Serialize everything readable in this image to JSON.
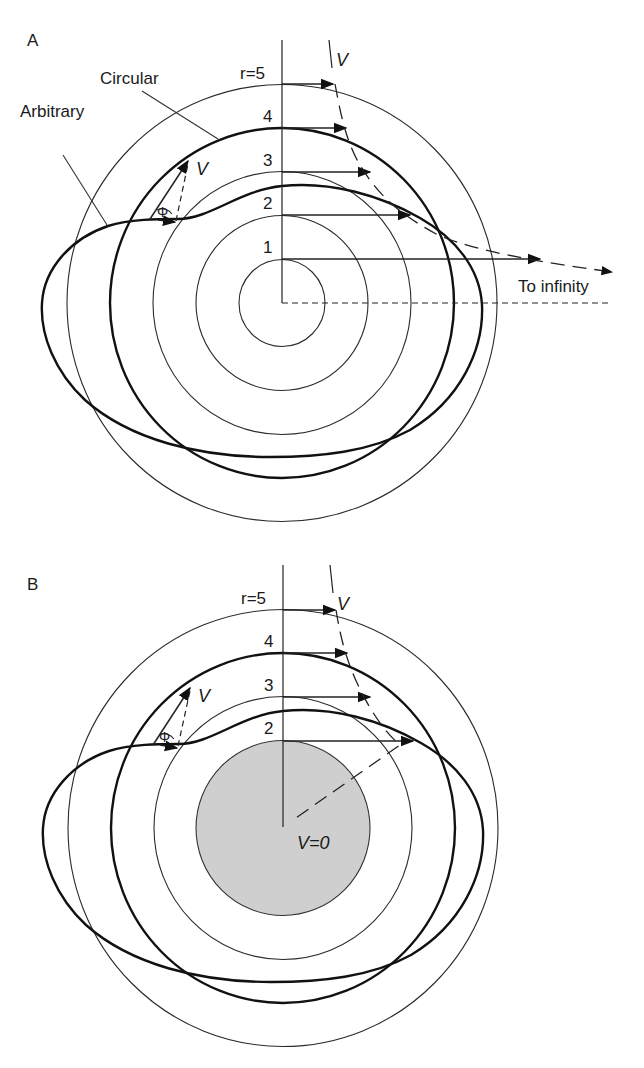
{
  "figure": {
    "panels": [
      {
        "id": "A",
        "label": "A",
        "center": [
          282,
          303
        ],
        "unit_radius_px": 43.3,
        "radius_labels": [
          "1",
          "2",
          "3",
          "4",
          "r=5"
        ],
        "curve_labels": {
          "circular": "Circular",
          "arbitrary": "Arbitrary"
        },
        "velocity_symbol": "V",
        "angle_symbol": "Φ",
        "far_field_label": "To infinity",
        "inner_boundary": "none"
      },
      {
        "id": "B",
        "label": "B",
        "center": [
          283,
          828
        ],
        "unit_radius_px": 43.3,
        "radius_labels": [
          "2",
          "3",
          "4",
          "r=5"
        ],
        "velocity_symbol": "V",
        "angle_symbol": "Φ",
        "inner_boundary": "shaded disk of radius 2",
        "inner_boundary_label": "V=0",
        "inner_boundary_color": "#cfcfcf"
      }
    ],
    "colors": {
      "line": "#222222",
      "background": "#ffffff",
      "shaded_disk": "#cfcfcf"
    }
  }
}
